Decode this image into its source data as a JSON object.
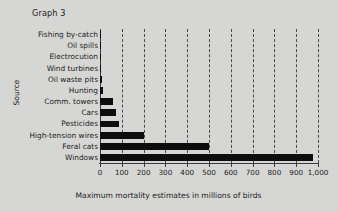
{
  "title": "Graph 3",
  "axis": {
    "y_title": "Source",
    "x_title": "Maximum mortality estimates in millions of birds"
  },
  "colors": {
    "background": "#d6d6d4",
    "bar": "#0d0d0d",
    "gridline": "#4a4a4a",
    "axis": "#3a3a3a",
    "text": "#1d1d1d"
  },
  "chart_data": {
    "type": "bar",
    "orientation": "horizontal",
    "title": "Graph 3",
    "xlabel": "Maximum mortality estimates in millions of birds",
    "ylabel": "Source",
    "xlim": [
      0,
      1000
    ],
    "xticks": [
      0,
      100,
      200,
      300,
      400,
      500,
      600,
      700,
      800,
      900,
      1000
    ],
    "xticklabels": [
      "0",
      "100",
      "200",
      "300",
      "400",
      "500",
      "600",
      "700",
      "800",
      "900",
      "1,000"
    ],
    "grid": true,
    "grid_axis": "x",
    "grid_style": "dashed",
    "legend": false,
    "categories": [
      "Fishing by-catch",
      "Oil spills",
      "Electrocution",
      "Wind turbines",
      "Oil waste pits",
      "Hunting",
      "Comm. towers",
      "Cars",
      "Pesticides",
      "High-tension wires",
      "Feral cats",
      "Windows"
    ],
    "values": [
      5,
      5,
      5,
      5,
      8,
      15,
      60,
      75,
      85,
      200,
      500,
      975
    ]
  }
}
